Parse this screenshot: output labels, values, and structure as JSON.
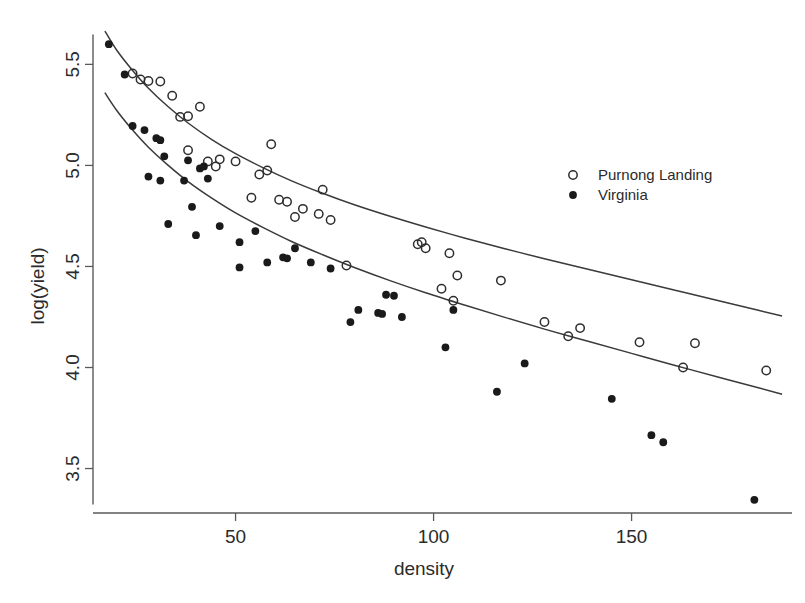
{
  "chart_data": {
    "type": "scatter",
    "title": "",
    "xlabel": "density",
    "ylabel": "log(yield)",
    "xlim": [
      14,
      190
    ],
    "ylim": [
      3.28,
      5.68
    ],
    "xticks": [
      50,
      100,
      150
    ],
    "xtick_labels": [
      "50",
      "100",
      "150"
    ],
    "yticks": [
      3.5,
      4.0,
      4.5,
      5.0,
      5.5
    ],
    "ytick_labels": [
      "3.5",
      "4.0",
      "4.5",
      "5.0",
      "5.5"
    ],
    "grid": false,
    "legend_position": "right",
    "series": [
      {
        "name": "Purnong Landing",
        "marker": "open-circle",
        "color": "#2e2e2e",
        "points": [
          [
            24,
            5.455
          ],
          [
            26,
            5.425
          ],
          [
            28,
            5.418
          ],
          [
            31,
            5.415
          ],
          [
            34,
            5.345
          ],
          [
            36,
            5.24
          ],
          [
            38,
            5.243
          ],
          [
            41,
            5.29
          ],
          [
            38,
            5.075
          ],
          [
            43,
            5.02
          ],
          [
            45,
            4.995
          ],
          [
            46,
            5.03
          ],
          [
            50,
            5.02
          ],
          [
            56,
            4.955
          ],
          [
            58,
            4.975
          ],
          [
            59,
            5.105
          ],
          [
            54,
            4.84
          ],
          [
            61,
            4.83
          ],
          [
            63,
            4.82
          ],
          [
            67,
            4.785
          ],
          [
            65,
            4.745
          ],
          [
            71,
            4.76
          ],
          [
            74,
            4.73
          ],
          [
            72,
            4.88
          ],
          [
            78,
            4.505
          ],
          [
            96,
            4.61
          ],
          [
            97,
            4.62
          ],
          [
            98,
            4.59
          ],
          [
            104,
            4.565
          ],
          [
            105,
            4.33
          ],
          [
            106,
            4.455
          ],
          [
            102,
            4.39
          ],
          [
            117,
            4.43
          ],
          [
            128,
            4.225
          ],
          [
            134,
            4.155
          ],
          [
            137,
            4.195
          ],
          [
            152,
            4.125
          ],
          [
            166,
            4.12
          ],
          [
            163,
            4.0
          ],
          [
            184,
            3.985
          ]
        ]
      },
      {
        "name": "Virginia",
        "marker": "filled-circle",
        "color": "#1a1a1a",
        "points": [
          [
            18,
            5.6
          ],
          [
            22,
            5.45
          ],
          [
            24,
            5.195
          ],
          [
            27,
            5.175
          ],
          [
            30,
            5.135
          ],
          [
            31,
            5.125
          ],
          [
            32,
            5.045
          ],
          [
            28,
            4.945
          ],
          [
            31,
            4.925
          ],
          [
            37,
            4.925
          ],
          [
            38,
            5.025
          ],
          [
            41,
            4.985
          ],
          [
            42,
            4.995
          ],
          [
            43,
            4.935
          ],
          [
            39,
            4.795
          ],
          [
            33,
            4.71
          ],
          [
            40,
            4.655
          ],
          [
            46,
            4.7
          ],
          [
            51,
            4.62
          ],
          [
            55,
            4.675
          ],
          [
            51,
            4.495
          ],
          [
            58,
            4.52
          ],
          [
            62,
            4.545
          ],
          [
            63,
            4.54
          ],
          [
            65,
            4.59
          ],
          [
            69,
            4.52
          ],
          [
            74,
            4.49
          ],
          [
            79,
            4.225
          ],
          [
            81,
            4.285
          ],
          [
            86,
            4.27
          ],
          [
            87,
            4.265
          ],
          [
            88,
            4.36
          ],
          [
            90,
            4.355
          ],
          [
            92,
            4.25
          ],
          [
            103,
            4.1
          ],
          [
            105,
            4.285
          ],
          [
            116,
            3.88
          ],
          [
            123,
            4.02
          ],
          [
            145,
            3.845
          ],
          [
            155,
            3.665
          ],
          [
            158,
            3.63
          ],
          [
            181,
            3.345
          ]
        ]
      }
    ],
    "fitted_curves": [
      {
        "name": "Purnong Landing fit",
        "for_series": "Purnong Landing",
        "points": [
          [
            17,
            5.665
          ],
          [
            20,
            5.57
          ],
          [
            24,
            5.47
          ],
          [
            28,
            5.382
          ],
          [
            33,
            5.29
          ],
          [
            38,
            5.21
          ],
          [
            44,
            5.128
          ],
          [
            50,
            5.058
          ],
          [
            57,
            4.988
          ],
          [
            64,
            4.925
          ],
          [
            72,
            4.862
          ],
          [
            80,
            4.805
          ],
          [
            89,
            4.748
          ],
          [
            98,
            4.695
          ],
          [
            108,
            4.64
          ],
          [
            118,
            4.588
          ],
          [
            128,
            4.538
          ],
          [
            139,
            4.486
          ],
          [
            150,
            4.434
          ],
          [
            161,
            4.382
          ],
          [
            172,
            4.33
          ],
          [
            182,
            4.283
          ],
          [
            188,
            4.255
          ]
        ]
      },
      {
        "name": "Virginia fit",
        "for_series": "Virginia",
        "points": [
          [
            17,
            5.36
          ],
          [
            20,
            5.272
          ],
          [
            24,
            5.175
          ],
          [
            28,
            5.09
          ],
          [
            33,
            5.0
          ],
          [
            38,
            4.92
          ],
          [
            44,
            4.838
          ],
          [
            50,
            4.765
          ],
          [
            57,
            4.692
          ],
          [
            64,
            4.625
          ],
          [
            72,
            4.558
          ],
          [
            80,
            4.495
          ],
          [
            89,
            4.43
          ],
          [
            98,
            4.37
          ],
          [
            108,
            4.308
          ],
          [
            118,
            4.248
          ],
          [
            128,
            4.19
          ],
          [
            139,
            4.13
          ],
          [
            150,
            4.07
          ],
          [
            161,
            4.01
          ],
          [
            172,
            3.952
          ],
          [
            182,
            3.9
          ],
          [
            188,
            3.868
          ]
        ]
      }
    ]
  },
  "legend": {
    "items": [
      {
        "label": "Purnong Landing",
        "marker": "open-circle"
      },
      {
        "label": "Virginia",
        "marker": "filled-circle"
      }
    ]
  }
}
